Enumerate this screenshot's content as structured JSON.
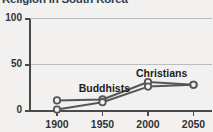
{
  "chart_data": {
    "type": "line",
    "title": "Religion in South Korea",
    "xlabel": "",
    "ylabel": "",
    "x": [
      1900,
      1950,
      2000,
      2050
    ],
    "xtick_labels": [
      "1900",
      "1950",
      "2000",
      "2050"
    ],
    "ytick_labels": [
      "0",
      "50",
      "100"
    ],
    "yticks": [
      0,
      50,
      100
    ],
    "ylim": [
      0,
      100
    ],
    "xlim": [
      1880,
      2065
    ],
    "grid": "horizontal",
    "legend": "inline-annotations",
    "marker": "open-circle",
    "series": [
      {
        "name": "Buddhists",
        "values": [
          11,
          12,
          31,
          28
        ],
        "color": "#55555a",
        "annotation_x": 1952,
        "annotation_y": 24
      },
      {
        "name": "Christians",
        "values": [
          1,
          9,
          26,
          28
        ],
        "color": "#55555a",
        "annotation_x": 2015,
        "annotation_y": 41
      }
    ],
    "colors": {
      "background": "#f2f1ef",
      "axis": "#4a4a4a",
      "grid": "#b9bcc0",
      "line": "#55555a",
      "marker_fill": "#f2f1ef",
      "title": "#2c3d4f",
      "tick_text": "#333333",
      "annotation_text": "#1d1d1d"
    }
  }
}
